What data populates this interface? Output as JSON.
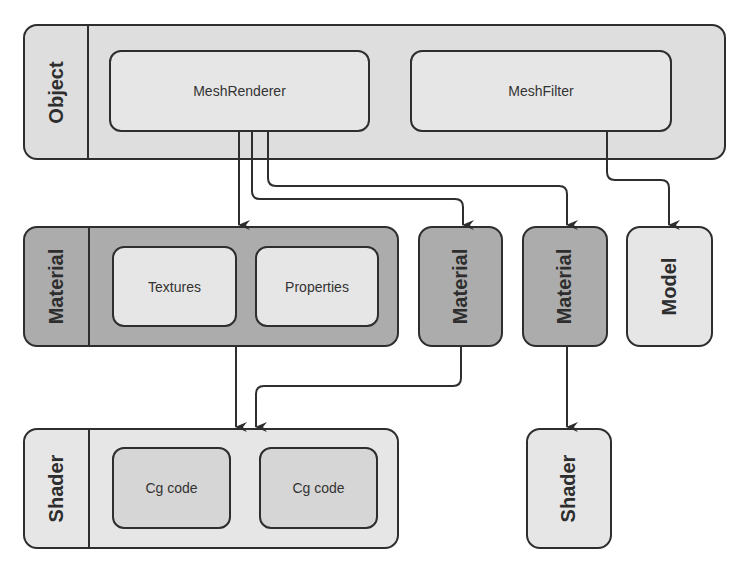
{
  "object": {
    "label": "Object",
    "components": [
      {
        "label": "MeshRenderer"
      },
      {
        "label": "MeshFilter"
      }
    ]
  },
  "materials": [
    {
      "label": "Material",
      "children": [
        {
          "label": "Textures"
        },
        {
          "label": "Properties"
        }
      ]
    },
    {
      "label": "Material"
    },
    {
      "label": "Material"
    }
  ],
  "model": {
    "label": "Model"
  },
  "shaders": [
    {
      "label": "Shader",
      "children": [
        {
          "label": "Cg code"
        },
        {
          "label": "Cg code"
        }
      ]
    },
    {
      "label": "Shader"
    }
  ],
  "colors": {
    "stroke": "#2e2e2e",
    "object_fill": "#dedede",
    "material_fill": "#acacac",
    "inner_fill": "#e6e6e6",
    "shader_fill": "#e6e6e6"
  }
}
